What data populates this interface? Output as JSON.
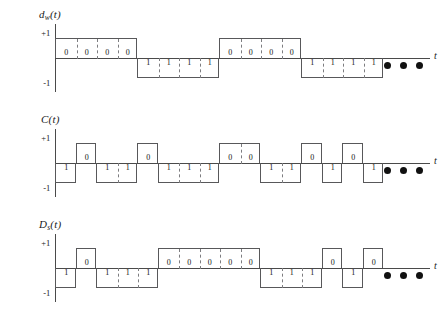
{
  "figure": {
    "time_axis_label": "t",
    "level_high_label": "+1",
    "level_low_label": "-1",
    "continuation_marker": "dots",
    "chips_per_bit": 4,
    "total_chips": 16,
    "bit_labels": {
      "one": "1",
      "zero": "0"
    }
  },
  "signals": [
    {
      "id": "data-signal",
      "label_main": "d",
      "label_sub": "w",
      "label_arg": "(t)",
      "label_text": "d",
      "ylabel_high": "+1",
      "ylabel_low": "-1",
      "axis_label": "t",
      "description": "input data signal",
      "bits": [
        "0",
        "1",
        "0",
        "1"
      ],
      "chips": [
        "0",
        "0",
        "0",
        "0",
        "1",
        "1",
        "1",
        "1",
        "0",
        "0",
        "0",
        "0",
        "1",
        "1",
        "1",
        "1"
      ]
    },
    {
      "id": "code-signal",
      "label_main": "C",
      "label_sub": "",
      "label_arg": "(t)",
      "label_text": "C",
      "ylabel_high": "+1",
      "ylabel_low": "-1",
      "axis_label": "t",
      "description": "pseudorandom spreading code",
      "chips": [
        "1",
        "0",
        "1",
        "1",
        "0",
        "1",
        "1",
        "1",
        "0",
        "0",
        "1",
        "1",
        "0",
        "1",
        "0",
        "1"
      ]
    },
    {
      "id": "spread-signal",
      "label_main": "D",
      "label_sub": "s",
      "label_arg": "(t)",
      "label_text": "D",
      "ylabel_high": "+1",
      "ylabel_low": "-1",
      "axis_label": "t",
      "description": "spread transmitted signal, data XOR code",
      "chips": [
        "1",
        "0",
        "1",
        "1",
        "1",
        "0",
        "0",
        "0",
        "0",
        "0",
        "1",
        "1",
        "1",
        "0",
        "1",
        "0"
      ]
    }
  ]
}
